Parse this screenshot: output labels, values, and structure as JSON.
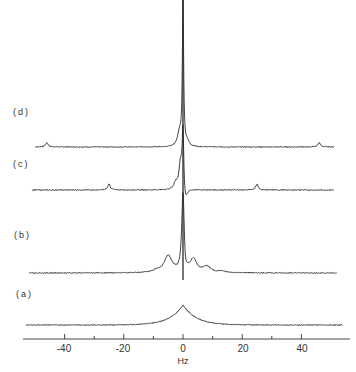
{
  "chart_data": {
    "type": "line",
    "title": "",
    "xlabel": "Hz",
    "ylabel": "",
    "xlim": [
      -53,
      53
    ],
    "x_ticks_major": [
      -40,
      -20,
      0,
      20,
      40
    ],
    "x_tick_labels": [
      "-40",
      "-20",
      "0",
      "20",
      "40"
    ],
    "x_ticks_minor": [
      -30,
      -10,
      10,
      30
    ],
    "grid": false,
    "legend": "none",
    "series": [
      {
        "name": "(d)",
        "label": "(d)",
        "baseline_y": 147,
        "x_start": -50,
        "x_end": 51,
        "peaks": [
          {
            "x": -46,
            "height": 4,
            "width": 0.6
          },
          {
            "x": -1.2,
            "height": 14,
            "width": 0.8
          },
          {
            "x": 0,
            "height": 147,
            "width": 0.25
          },
          {
            "x": 1.5,
            "height": 4,
            "width": 0.7
          },
          {
            "x": 46,
            "height": 4,
            "width": 0.6
          }
        ]
      },
      {
        "name": "(c)",
        "label": "(c)",
        "baseline_y": 190,
        "x_start": -51,
        "x_end": 51,
        "peaks": [
          {
            "x": -25,
            "height": 6,
            "width": 0.5
          },
          {
            "x": -2.5,
            "height": 6,
            "width": 0.7
          },
          {
            "x": -0.8,
            "height": 28,
            "width": 0.7
          },
          {
            "x": 0,
            "height": 60,
            "width": 0.3
          },
          {
            "x": 0.8,
            "height": -14,
            "width": 0.8
          },
          {
            "x": 25,
            "height": 6,
            "width": 0.5
          }
        ]
      },
      {
        "name": "(b)",
        "label": "(b)",
        "baseline_y": 273,
        "x_start": -52,
        "x_end": 52,
        "peaks": [
          {
            "x": -9,
            "height": 2,
            "width": 1.2
          },
          {
            "x": -5,
            "height": 17,
            "width": 1.6
          },
          {
            "x": 0,
            "height": 80,
            "width": 0.5
          },
          {
            "x": 0.8,
            "height": -8,
            "width": 0.5
          },
          {
            "x": 3.5,
            "height": 13,
            "width": 1.3
          },
          {
            "x": 8,
            "height": 6,
            "width": 1.6
          },
          {
            "x": 13,
            "height": 1.5,
            "width": 1.2
          }
        ]
      },
      {
        "name": "(a)",
        "label": "(a)",
        "baseline_y": 325,
        "x_start": -53,
        "x_end": 54,
        "peaks": [
          {
            "x": 0,
            "height": 20,
            "width": 4.5,
            "shape": "cusp"
          }
        ]
      }
    ]
  },
  "labels": {
    "trace_d": "(d)",
    "trace_c": "(c)",
    "trace_b": "(b)",
    "trace_a": "(a)",
    "axis_title": "Hz",
    "ticks": [
      "-40",
      "-20",
      "0",
      "20",
      "40"
    ]
  },
  "colors": {
    "trace": "#2a2a2a",
    "axis": "#333333",
    "background": "#ffffff"
  }
}
